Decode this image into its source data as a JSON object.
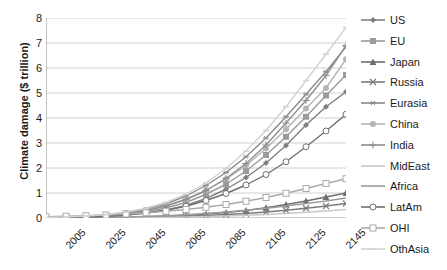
{
  "chart_data": {
    "type": "line",
    "title": "",
    "xlabel": "",
    "ylabel": "Climate damage ($ trillion)",
    "ylim": [
      0,
      8
    ],
    "yticks": [
      0,
      1,
      2,
      3,
      4,
      5,
      6,
      7,
      8
    ],
    "ytick_labels": [
      "0",
      "1",
      "2",
      "3",
      "4",
      "5",
      "6",
      "7",
      "8"
    ],
    "xlim": [
      2005,
      2155
    ],
    "xticks": [
      2005,
      2025,
      2045,
      2065,
      2085,
      2105,
      2125,
      2145
    ],
    "xtick_labels": [
      "2005",
      "2025",
      "2045",
      "2065",
      "2085",
      "2105",
      "2125",
      "2145"
    ],
    "x": [
      2005,
      2015,
      2025,
      2035,
      2045,
      2055,
      2065,
      2075,
      2085,
      2095,
      2105,
      2115,
      2125,
      2135,
      2145,
      2155
    ],
    "grid": "horizontal",
    "legend_position": "right",
    "series": [
      {
        "name": "US",
        "marker": "diamond",
        "color": "#808080",
        "values": [
          0.01,
          0.02,
          0.04,
          0.07,
          0.12,
          0.2,
          0.32,
          0.5,
          0.78,
          1.15,
          1.62,
          2.2,
          2.9,
          3.72,
          4.45,
          5.05
        ]
      },
      {
        "name": "EU",
        "marker": "square",
        "color": "#9a9a9a",
        "values": [
          0.01,
          0.02,
          0.05,
          0.09,
          0.15,
          0.25,
          0.4,
          0.62,
          0.95,
          1.35,
          1.88,
          2.52,
          3.25,
          4.05,
          4.9,
          5.72
        ]
      },
      {
        "name": "Japan",
        "marker": "triangle",
        "color": "#6e6e6e",
        "values": [
          0.0,
          0.01,
          0.01,
          0.02,
          0.03,
          0.05,
          0.08,
          0.11,
          0.16,
          0.22,
          0.3,
          0.41,
          0.54,
          0.68,
          0.84,
          1.0
        ]
      },
      {
        "name": "Russia",
        "marker": "x",
        "color": "#7a7a7a",
        "values": [
          0.0,
          0.0,
          0.01,
          0.01,
          0.02,
          0.03,
          0.05,
          0.07,
          0.1,
          0.14,
          0.18,
          0.24,
          0.31,
          0.39,
          0.48,
          0.58
        ]
      },
      {
        "name": "Eurasia",
        "marker": "asterisk",
        "color": "#8a8a8a",
        "values": [
          0.02,
          0.04,
          0.07,
          0.13,
          0.22,
          0.36,
          0.57,
          0.88,
          1.3,
          1.82,
          2.45,
          3.2,
          4.05,
          4.95,
          5.85,
          6.85
        ]
      },
      {
        "name": "China",
        "marker": "circle-fill",
        "color": "#b5b5b5",
        "values": [
          0.01,
          0.03,
          0.06,
          0.11,
          0.19,
          0.31,
          0.49,
          0.75,
          1.1,
          1.55,
          2.1,
          2.78,
          3.55,
          4.38,
          5.2,
          6.35
        ]
      },
      {
        "name": "India",
        "marker": "plus",
        "color": "#8f8f8f",
        "values": [
          0.01,
          0.02,
          0.05,
          0.1,
          0.18,
          0.3,
          0.48,
          0.74,
          1.1,
          1.58,
          2.18,
          2.92,
          3.8,
          4.7,
          5.7,
          6.9
        ]
      },
      {
        "name": "MidEast",
        "marker": "none",
        "color": "#c8c8c8",
        "values": [
          0.0,
          0.0,
          0.0,
          0.01,
          0.01,
          0.02,
          0.03,
          0.04,
          0.06,
          0.08,
          0.11,
          0.14,
          0.18,
          0.23,
          0.28,
          0.34
        ]
      },
      {
        "name": "Africa",
        "marker": "none",
        "color": "#9c9c9c",
        "values": [
          0.0,
          0.01,
          0.01,
          0.02,
          0.04,
          0.06,
          0.09,
          0.13,
          0.18,
          0.24,
          0.31,
          0.39,
          0.48,
          0.58,
          0.68,
          0.8
        ]
      },
      {
        "name": "LatAm",
        "marker": "circle-open",
        "color": "#707070",
        "values": [
          0.01,
          0.02,
          0.04,
          0.07,
          0.12,
          0.2,
          0.31,
          0.47,
          0.7,
          0.98,
          1.32,
          1.74,
          2.25,
          2.85,
          3.48,
          4.15
        ]
      },
      {
        "name": "OHI",
        "marker": "square-open",
        "color": "#aaaaaa",
        "values": [
          0.05,
          0.07,
          0.09,
          0.12,
          0.16,
          0.21,
          0.27,
          0.34,
          0.43,
          0.54,
          0.67,
          0.82,
          0.99,
          1.18,
          1.38,
          1.57
        ]
      },
      {
        "name": "OthAsia",
        "marker": "dash",
        "color": "#d2d2d2",
        "values": [
          0.02,
          0.04,
          0.08,
          0.14,
          0.24,
          0.39,
          0.62,
          0.95,
          1.4,
          1.98,
          2.68,
          3.5,
          4.45,
          5.5,
          6.55,
          7.62
        ]
      }
    ]
  },
  "axis": {
    "y_title": "Climate damage ($ trillion)"
  },
  "legend": {
    "items": [
      {
        "label": "US"
      },
      {
        "label": "EU"
      },
      {
        "label": "Japan"
      },
      {
        "label": "Russia"
      },
      {
        "label": "Eurasia"
      },
      {
        "label": "China"
      },
      {
        "label": "India"
      },
      {
        "label": "MidEast"
      },
      {
        "label": "Africa"
      },
      {
        "label": "LatAm"
      },
      {
        "label": "OHI"
      },
      {
        "label": "OthAsia"
      }
    ]
  }
}
